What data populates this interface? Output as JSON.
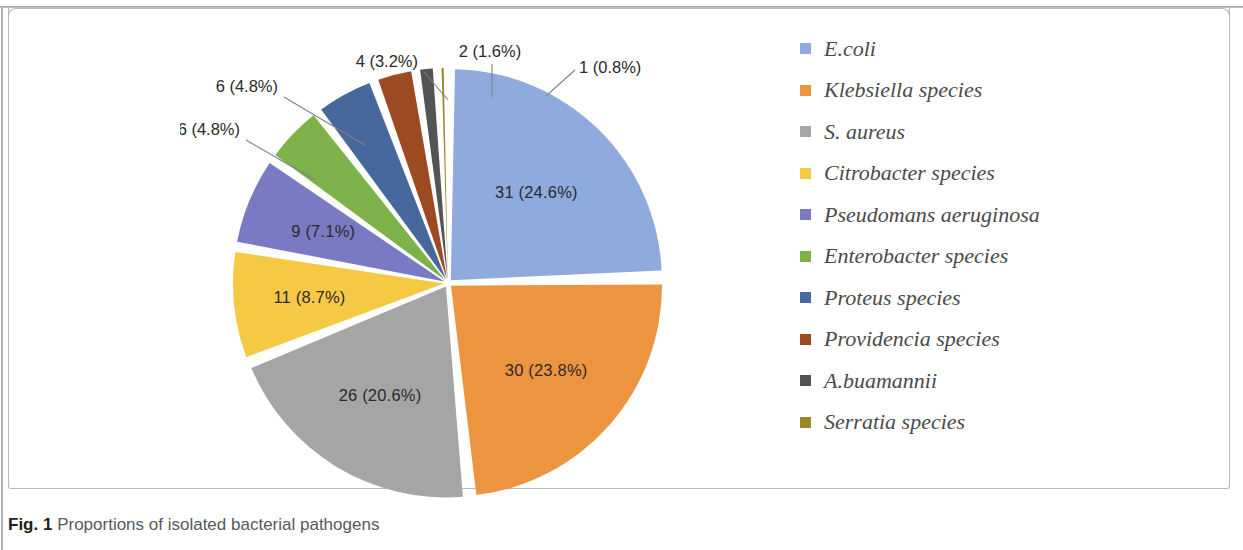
{
  "figure": {
    "caption_number": "Fig. 1",
    "caption_text": " Proportions of isolated bacterial pathogens"
  },
  "chart_data": {
    "type": "pie",
    "title": "Proportions of isolated bacterial pathogens",
    "total": 126,
    "legend_position": "right",
    "grid": false,
    "categories": [
      "E.coli",
      "Klebsiella species",
      "S. aureus",
      "Citrobacter species",
      "Pseudomans aeruginosa",
      "Enterobacter species",
      "Proteus species",
      "Providencia species",
      "A.buamannii",
      "Serratia species"
    ],
    "values": [
      31,
      30,
      26,
      11,
      9,
      6,
      6,
      4,
      2,
      1
    ],
    "percents": [
      24.6,
      23.8,
      20.6,
      8.7,
      7.1,
      4.8,
      4.8,
      3.2,
      1.6,
      0.8
    ],
    "colors": [
      "#8faadc",
      "#ed9440",
      "#a5a5a5",
      "#f6c944",
      "#7a7ac4",
      "#7cb249",
      "#47689c",
      "#9c4a21",
      "#545454",
      "#9a8a24"
    ],
    "data_labels": [
      "31  (24.6%)",
      "30 (23.8%)",
      "26 (20.6%)",
      "11 (8.7%)",
      "9 (7.1%)",
      "6 (4.8%)",
      "6 (4.8%)",
      "4 (3.2%)",
      "2 (1.6%)",
      "1 (0.8%)"
    ]
  },
  "legend": {
    "items": [
      {
        "label": "E.coli",
        "color": "#8faadc"
      },
      {
        "label": "Klebsiella species",
        "color": "#ed9440"
      },
      {
        "label": "S. aureus",
        "color": "#a5a5a5"
      },
      {
        "label": "Citrobacter species",
        "color": "#f6c944"
      },
      {
        "label": "Pseudomans aeruginosa",
        "color": "#7a7ac4"
      },
      {
        "label": "Enterobacter species",
        "color": "#7cb249"
      },
      {
        "label": "Proteus species",
        "color": "#47689c"
      },
      {
        "label": "Providencia species",
        "color": "#9c4a21"
      },
      {
        "label": "A.buamannii",
        "color": "#545454"
      },
      {
        "label": "Serratia species",
        "color": "#9a8a24"
      }
    ]
  },
  "pie_labels": {
    "inside": [
      {
        "key": "ecoli",
        "text": "31  (24.6%)"
      },
      {
        "key": "klebsiella",
        "text": "30 (23.8%)"
      },
      {
        "key": "saureus",
        "text": "26 (20.6%)"
      },
      {
        "key": "citrobacter",
        "text": "11 (8.7%)"
      },
      {
        "key": "pseudomonas",
        "text": "9 (7.1%)"
      }
    ],
    "callouts": [
      {
        "key": "enterobacter",
        "text": "6 (4.8%)"
      },
      {
        "key": "proteus",
        "text": "6 (4.8%)"
      },
      {
        "key": "providencia",
        "text": "4 (3.2%)"
      },
      {
        "key": "abuamannii",
        "text": "2 (1.6%)"
      },
      {
        "key": "serratia",
        "text": "1 (0.8%)"
      }
    ]
  }
}
